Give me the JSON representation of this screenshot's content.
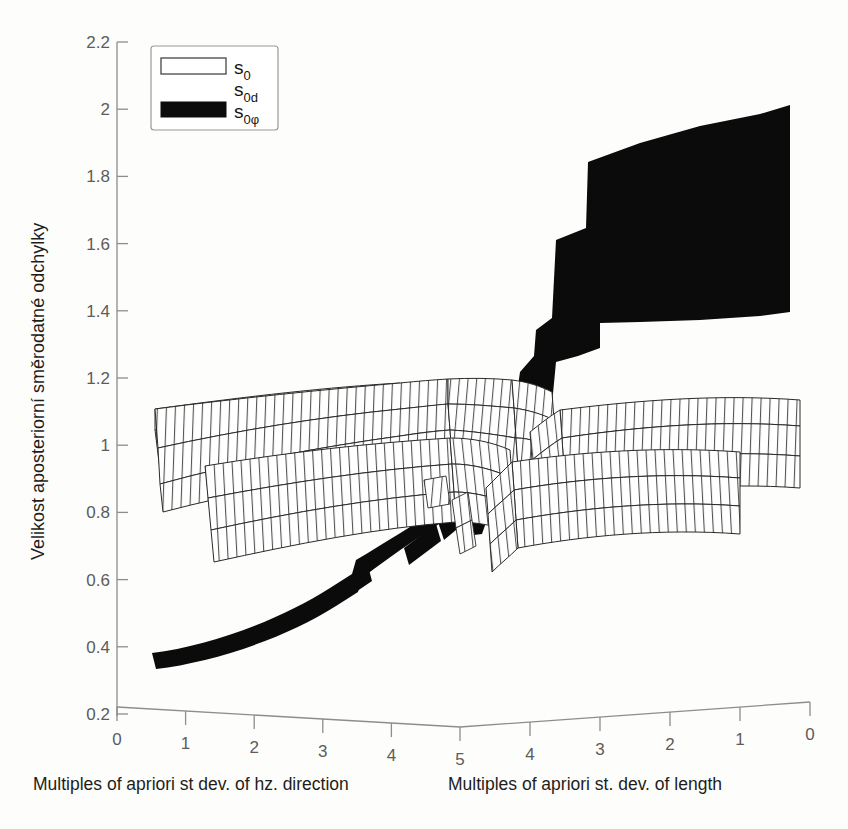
{
  "chart_data": {
    "type": "area",
    "title": "",
    "subtitle": "",
    "ylabel": "Velikost aposteriorní směrodatné odchylky",
    "ylim": [
      0.2,
      2.2
    ],
    "ytick_labels": [
      "2.2",
      "2",
      "1.8",
      "1.6",
      "1.4",
      "1.2",
      "1",
      "0.8",
      "0.6",
      "0.4",
      "0.2"
    ],
    "ytick_values": [
      2.2,
      2.0,
      1.8,
      1.6,
      1.4,
      1.2,
      1.0,
      0.8,
      0.6,
      0.4,
      0.2
    ],
    "grid": false,
    "legend_position": "top-left",
    "x_axes": [
      {
        "id": "hz-direction",
        "label": "Multiples of apriori st dev. of hz. direction",
        "tick_labels": [
          "0",
          "1",
          "2",
          "3",
          "4",
          "5"
        ],
        "tick_values": [
          0,
          1,
          2,
          3,
          4,
          5
        ],
        "direction": "left-to-right"
      },
      {
        "id": "length",
        "label": "Multiples of apriori st. dev. of length",
        "tick_labels": [
          "4",
          "3",
          "2",
          "1",
          "0"
        ],
        "tick_values": [
          4,
          3,
          2,
          1,
          0
        ],
        "direction": "right-to-left"
      }
    ],
    "series": [
      {
        "name": "s0",
        "style": "mesh-white",
        "description": "aposteriori unit weight standard deviation surface, white wireframe ribbon band",
        "left_branch": {
          "x_start": 0.6,
          "x_end": 4.6,
          "y_top_start": 1.11,
          "y_top_end": 1.05,
          "y_bottom_start": 0.83,
          "y_bottom_end": 0.82
        },
        "right_branch": {
          "x_start": 4.4,
          "x_end": 0.55,
          "y_top_start": 0.86,
          "y_top_end": 1.05,
          "y_bottom_start": 0.8,
          "y_bottom_end": 0.89
        }
      },
      {
        "name": "s0d",
        "style": "mesh-white",
        "description": "distance component surface, white wireframe ribbon band offset below s0",
        "left_branch": {
          "x_start": 0.65,
          "x_end": 4.55,
          "y_top_start": 1.05,
          "y_top_end": 0.96,
          "y_bottom_start": 0.76,
          "y_bottom_end": 0.8
        },
        "right_branch": {
          "x_start": 4.3,
          "x_end": 0.6,
          "y_top_start": 0.92,
          "y_top_end": 1.16,
          "y_bottom_start": 0.79,
          "y_bottom_end": 0.78
        }
      },
      {
        "name": "s0phi",
        "style": "solid-black",
        "description": "direction component surface, filled black band rising steeply to the right",
        "left_branch": {
          "x_start": 0.6,
          "x_end": 5.0,
          "y_top_start": 0.39,
          "y_top_end": 0.82,
          "y_bottom_start": 0.35,
          "y_bottom_end": 0.8
        },
        "right_branch": {
          "x_start": 5.0,
          "x_end": 0.6,
          "y_top_start": 0.82,
          "y_top_end": 2.03,
          "y_bottom_start": 0.79,
          "y_bottom_end": 1.42
        }
      }
    ]
  },
  "legend": {
    "entries": [
      {
        "label_main": "s",
        "label_sub": "0",
        "swatch": "open",
        "name": "s0"
      },
      {
        "label_main": "s",
        "label_sub": "0d",
        "swatch": "none",
        "name": "s0d"
      },
      {
        "label_main": "s",
        "label_sub": "0φ",
        "swatch": "filled",
        "name": "s0phi"
      }
    ]
  },
  "colors": {
    "background": "#fdfdfc",
    "axis": "#8d8d8a",
    "tick_label": "#5c5c5a",
    "mesh_stroke": "#2a2a28",
    "filled_series": "#0b0b0b",
    "text": "#1d1d1b"
  }
}
